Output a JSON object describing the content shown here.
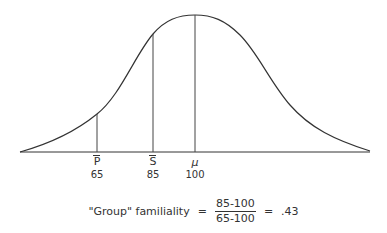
{
  "diagram": {
    "type": "normal-distribution-curve",
    "markers": [
      {
        "symbol": "P",
        "overbar": true,
        "value": "65",
        "x": 97,
        "top": 114
      },
      {
        "symbol": "S",
        "overbar": true,
        "value": "85",
        "x": 153,
        "top": 34
      },
      {
        "symbol": "μ",
        "overbar": false,
        "value": "100",
        "x": 195,
        "top": 15
      }
    ],
    "formula": {
      "label": "\"Group\" familiality",
      "equals1": "=",
      "numerator": "85-100",
      "denominator": "65-100",
      "equals2": "=",
      "result": ".43"
    }
  }
}
